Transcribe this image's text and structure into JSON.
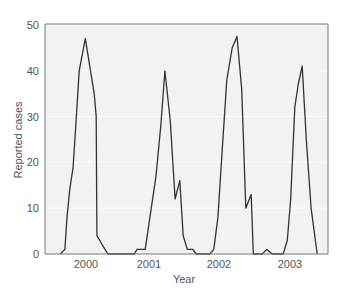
{
  "chart_data": {
    "type": "line",
    "title": "",
    "xlabel": "Year",
    "ylabel": "Reported cases",
    "ylim": [
      0,
      50
    ],
    "xlim": [
      1999.7,
      2003.55
    ],
    "yticks": [
      0,
      10,
      20,
      30,
      40,
      50
    ],
    "xticks": [
      {
        "label": "2000",
        "value": 2000
      },
      {
        "label": "2001",
        "value": 2001
      },
      {
        "label": "2002",
        "value": 2002
      },
      {
        "label": "2003",
        "value": 2003
      }
    ],
    "grid": true,
    "legend": null,
    "series": [
      {
        "name": "Reported cases",
        "color": "#333333",
        "points": [
          [
            1999.62,
            0
          ],
          [
            1999.69,
            1
          ],
          [
            1999.72,
            8
          ],
          [
            1999.76,
            14
          ],
          [
            1999.81,
            19
          ],
          [
            1999.85,
            28
          ],
          [
            1999.9,
            40
          ],
          [
            1999.99,
            47
          ],
          [
            2000.12,
            35
          ],
          [
            2000.15,
            30
          ],
          [
            2000.16,
            4
          ],
          [
            2000.24,
            2
          ],
          [
            2000.32,
            0
          ],
          [
            2000.71,
            0
          ],
          [
            2000.75,
            1
          ],
          [
            2000.87,
            1
          ],
          [
            2000.94,
            8
          ],
          [
            2001.03,
            17
          ],
          [
            2001.1,
            28
          ],
          [
            2001.16,
            40
          ],
          [
            2001.24,
            29
          ],
          [
            2001.31,
            12
          ],
          [
            2001.38,
            16
          ],
          [
            2001.43,
            4
          ],
          [
            2001.49,
            1
          ],
          [
            2001.57,
            1
          ],
          [
            2001.62,
            0
          ],
          [
            2001.82,
            0
          ],
          [
            2001.88,
            1
          ],
          [
            2001.94,
            8
          ],
          [
            2002.0,
            22
          ],
          [
            2002.07,
            38
          ],
          [
            2002.15,
            45
          ],
          [
            2002.22,
            47.5
          ],
          [
            2002.29,
            36
          ],
          [
            2002.35,
            10
          ],
          [
            2002.43,
            13
          ],
          [
            2002.46,
            0
          ],
          [
            2002.59,
            0
          ],
          [
            2002.66,
            1
          ],
          [
            2002.74,
            0
          ],
          [
            2002.9,
            0
          ],
          [
            2002.96,
            3
          ],
          [
            2003.01,
            12
          ],
          [
            2003.07,
            32
          ],
          [
            2003.12,
            37
          ],
          [
            2003.18,
            41
          ],
          [
            2003.24,
            25
          ],
          [
            2003.31,
            10
          ],
          [
            2003.4,
            0
          ]
        ]
      }
    ]
  },
  "colors": {
    "plot_background": "#f2f2f2",
    "grid": "#fbfbfb",
    "axis": "#666666",
    "line": "#333333",
    "text": "#555555"
  }
}
